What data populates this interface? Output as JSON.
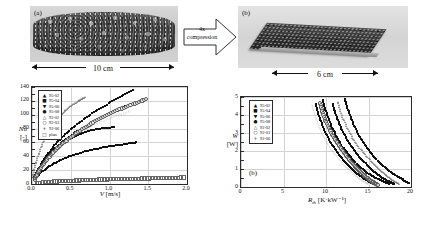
{
  "figure": {
    "panel_a": {
      "tag": "(a)",
      "scalebar_label": "10 cm",
      "description": "uncompressed metal foam cylinder photograph"
    },
    "panel_b": {
      "tag": "(b)",
      "scalebar_label": "6 cm",
      "description": "4x compressed flat metal foam plate photograph"
    },
    "compression_arrow": {
      "line1": "4x",
      "line2": "compression"
    }
  },
  "chart_data": [
    {
      "id": "nusselt-chart",
      "type": "scatter",
      "title": "",
      "xlabel": "V",
      "xunit": "[m/s]",
      "ylabel": "Nu",
      "yunit": "[-]",
      "xlim": [
        0.0,
        2.0
      ],
      "ylim": [
        0,
        140
      ],
      "xticks": [
        "0.0",
        "0.5",
        "1.0",
        "1.5",
        "2.0"
      ],
      "xtick_values": [
        0.0,
        0.5,
        1.0,
        1.5,
        2.0
      ],
      "yticks": [
        "0",
        "20",
        "40",
        "60",
        "80",
        "100",
        "120",
        "140"
      ],
      "ytick_values": [
        0,
        20,
        40,
        60,
        80,
        100,
        120,
        140
      ],
      "grid": true,
      "legend_position": "top-left",
      "legend": [
        {
          "label": "95-02",
          "marker": "filled-triangle"
        },
        {
          "label": "95-04",
          "marker": "filled-square"
        },
        {
          "label": "95-06",
          "marker": "filled-down-triangle"
        },
        {
          "label": "95-08",
          "marker": "filled-circle"
        },
        {
          "label": "92-02",
          "marker": "open-triangle"
        },
        {
          "label": "92-03",
          "marker": "open-circle"
        },
        {
          "label": "92-06",
          "marker": "plus"
        },
        {
          "label": "plate",
          "marker": "open-square"
        }
      ],
      "series": [
        {
          "name": "95-02",
          "marker": "filled-triangle",
          "x": [
            0.02,
            0.06,
            0.11,
            0.17,
            0.24,
            0.32,
            0.41,
            0.5,
            0.6,
            0.71,
            0.82,
            0.94,
            1.06,
            1.18,
            1.3
          ],
          "y": [
            8,
            17,
            27,
            38,
            49,
            60,
            70,
            79,
            88,
            97,
            105,
            113,
            121,
            128,
            135
          ]
        },
        {
          "name": "95-04",
          "marker": "filled-square",
          "x": [
            0.02,
            0.05,
            0.09,
            0.14,
            0.2,
            0.27,
            0.34,
            0.42,
            0.5,
            0.59,
            0.68,
            0.78,
            0.88,
            0.98,
            1.06
          ],
          "y": [
            7,
            14,
            22,
            30,
            38,
            46,
            53,
            60,
            66,
            71,
            75,
            78,
            80,
            81,
            82
          ]
        },
        {
          "name": "95-06",
          "marker": "filled-down-triangle",
          "x": [
            0.02,
            0.05,
            0.09,
            0.14,
            0.2,
            0.27,
            0.35,
            0.44,
            0.54,
            0.64,
            0.75,
            0.86,
            0.97,
            1.08,
            1.2
          ],
          "y": [
            7,
            14,
            22,
            31,
            40,
            49,
            57,
            65,
            73,
            80,
            87,
            94,
            100,
            106,
            112
          ]
        },
        {
          "name": "95-08",
          "marker": "filled-circle",
          "x": [
            0.02,
            0.06,
            0.12,
            0.19,
            0.27,
            0.36,
            0.46,
            0.57,
            0.68,
            0.8,
            0.92,
            1.04,
            1.16,
            1.28,
            1.34
          ],
          "y": [
            6,
            11,
            17,
            23,
            29,
            34,
            39,
            43,
            47,
            50,
            53,
            55,
            57,
            59,
            60
          ]
        },
        {
          "name": "92-02",
          "marker": "open-triangle",
          "x": [
            0.01,
            0.03,
            0.06,
            0.1,
            0.14,
            0.19,
            0.24,
            0.3,
            0.36,
            0.42,
            0.48,
            0.54,
            0.6,
            0.64,
            0.68
          ],
          "y": [
            10,
            22,
            35,
            48,
            60,
            71,
            81,
            90,
            98,
            105,
            111,
            116,
            120,
            123,
            125
          ]
        },
        {
          "name": "92-03",
          "marker": "open-circle",
          "x": [
            0.02,
            0.06,
            0.11,
            0.18,
            0.26,
            0.35,
            0.45,
            0.56,
            0.68,
            0.8,
            0.93,
            1.06,
            1.2,
            1.34,
            1.46
          ],
          "y": [
            8,
            17,
            27,
            37,
            47,
            57,
            66,
            75,
            84,
            92,
            100,
            107,
            113,
            119,
            124
          ]
        },
        {
          "name": "92-06",
          "marker": "plus",
          "x": [
            0.02,
            0.05,
            0.1,
            0.16,
            0.23,
            0.31,
            0.4,
            0.5,
            0.6,
            0.71,
            0.82,
            0.93,
            1.04,
            1.15,
            1.26
          ],
          "y": [
            7,
            14,
            23,
            32,
            41,
            50,
            58,
            66,
            73,
            80,
            86,
            91,
            96,
            100,
            104
          ]
        },
        {
          "name": "plate",
          "marker": "open-square",
          "x": [
            0.05,
            0.15,
            0.25,
            0.35,
            0.45,
            0.55,
            0.65,
            0.75,
            0.85,
            0.95,
            1.05,
            1.15,
            1.25,
            1.35,
            1.45,
            1.55,
            1.65,
            1.75,
            1.85,
            1.95
          ],
          "y": [
            3,
            4,
            5,
            5.5,
            6,
            6.5,
            7,
            7.5,
            8,
            8.2,
            8.5,
            8.8,
            9,
            9.3,
            9.5,
            9.8,
            10,
            10.3,
            10.6,
            11
          ]
        }
      ]
    },
    {
      "id": "power-resistance-chart",
      "type": "scatter",
      "tag": "(b)",
      "title": "",
      "xlabel": "R",
      "xsub": "th",
      "xunit": "[K·kW⁻¹]",
      "ylabel": "W",
      "yunit": "[W]",
      "xlim": [
        0,
        20
      ],
      "ylim": [
        0,
        5
      ],
      "xticks": [
        "0",
        "5",
        "10",
        "15",
        "20"
      ],
      "xtick_values": [
        0,
        5,
        10,
        15,
        20
      ],
      "yticks": [
        "0",
        "1",
        "2",
        "3",
        "4",
        "5"
      ],
      "ytick_values": [
        0,
        1,
        2,
        3,
        4,
        5
      ],
      "grid": true,
      "legend_position": "top-left",
      "legend": [
        {
          "label": "95-02",
          "marker": "filled-triangle"
        },
        {
          "label": "95-04",
          "marker": "filled-square"
        },
        {
          "label": "95-06",
          "marker": "filled-down-triangle"
        },
        {
          "label": "95-08",
          "marker": "filled-circle"
        },
        {
          "label": "92-02",
          "marker": "open-triangle"
        },
        {
          "label": "92-03",
          "marker": "open-circle"
        },
        {
          "label": "92-06",
          "marker": "plus"
        }
      ],
      "series": [
        {
          "name": "95-02",
          "marker": "filled-triangle",
          "x": [
            12.2,
            12.5,
            12.9,
            13.3,
            13.8,
            14.3,
            14.9,
            15.5,
            16.2,
            16.9,
            17.6,
            18.3,
            18.9,
            19.4,
            19.8
          ],
          "y": [
            4.9,
            4.4,
            3.9,
            3.4,
            2.95,
            2.5,
            2.1,
            1.75,
            1.4,
            1.1,
            0.85,
            0.6,
            0.45,
            0.3,
            0.2
          ]
        },
        {
          "name": "95-04",
          "marker": "filled-square",
          "x": [
            9.6,
            9.9,
            10.3,
            10.7,
            11.2,
            11.7,
            12.3,
            12.9,
            13.6,
            14.3,
            15.0,
            15.7,
            16.3,
            16.9,
            17.4
          ],
          "y": [
            4.85,
            4.3,
            3.8,
            3.3,
            2.85,
            2.4,
            2.0,
            1.65,
            1.3,
            1.0,
            0.75,
            0.55,
            0.4,
            0.28,
            0.18
          ]
        },
        {
          "name": "95-06",
          "marker": "filled-down-triangle",
          "x": [
            10.8,
            11.1,
            11.5,
            11.9,
            12.4,
            12.9,
            13.5,
            14.1,
            14.8,
            15.4,
            16.0,
            16.6,
            17.1,
            17.6,
            18.0
          ],
          "y": [
            4.6,
            4.1,
            3.6,
            3.15,
            2.7,
            2.3,
            1.9,
            1.55,
            1.25,
            0.95,
            0.72,
            0.52,
            0.38,
            0.26,
            0.17
          ]
        },
        {
          "name": "95-08",
          "marker": "filled-circle",
          "x": [
            8.8,
            9.1,
            9.5,
            9.9,
            10.4,
            10.9,
            11.5,
            12.1,
            12.7,
            13.3,
            13.9,
            14.4,
            14.9,
            15.3,
            15.7
          ],
          "y": [
            4.6,
            4.05,
            3.55,
            3.05,
            2.6,
            2.2,
            1.8,
            1.45,
            1.15,
            0.88,
            0.66,
            0.48,
            0.34,
            0.23,
            0.15
          ]
        },
        {
          "name": "92-02",
          "marker": "open-triangle",
          "x": [
            11.4,
            11.7,
            12.1,
            12.6,
            13.1,
            13.7,
            14.3,
            15.0,
            15.6,
            16.2,
            16.8,
            17.3,
            17.8,
            18.2,
            18.6
          ],
          "y": [
            4.75,
            4.2,
            3.7,
            3.2,
            2.75,
            2.35,
            1.95,
            1.6,
            1.28,
            1.0,
            0.76,
            0.56,
            0.4,
            0.27,
            0.18
          ]
        },
        {
          "name": "92-03",
          "marker": "open-circle",
          "x": [
            9.2,
            9.5,
            9.9,
            10.4,
            10.9,
            11.5,
            12.1,
            12.7,
            13.3,
            13.9,
            14.4,
            14.9,
            15.3,
            15.7,
            16.0
          ],
          "y": [
            4.7,
            4.15,
            3.65,
            3.15,
            2.7,
            2.28,
            1.88,
            1.52,
            1.2,
            0.92,
            0.7,
            0.5,
            0.36,
            0.24,
            0.16
          ]
        },
        {
          "name": "92-06",
          "marker": "plus",
          "x": [
            8.3,
            8.6,
            9.0,
            9.4,
            9.9,
            10.4,
            11.0,
            11.6,
            12.2,
            12.8,
            13.3,
            13.8,
            14.2,
            14.6,
            14.9
          ],
          "y": [
            4.5,
            4.0,
            3.5,
            3.0,
            2.55,
            2.15,
            1.78,
            1.43,
            1.13,
            0.87,
            0.65,
            0.47,
            0.33,
            0.22,
            0.14
          ]
        }
      ]
    }
  ]
}
